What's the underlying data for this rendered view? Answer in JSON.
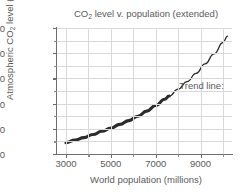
{
  "chart_data": {
    "type": "line",
    "title": "CO2 level v. population (extended)",
    "title_parts": {
      "pre": "CO",
      "sub": "2",
      "post": " level v. population (extended)"
    },
    "xlabel": "World population (millions)",
    "ylabel": "Atmospheric CO2 level (ppm)",
    "ylabel_parts": {
      "pre": "Atmospheric CO",
      "sub": "2",
      "post": " level (ppm)"
    },
    "xlim": [
      2600,
      10400
    ],
    "ylim": [
      300,
      500
    ],
    "x_ticks_major": [
      3000,
      5000,
      7000,
      9000
    ],
    "x_ticks_minor": [
      4000,
      6000,
      8000,
      10000
    ],
    "x_tick_labels": [
      "3000",
      "5000",
      "7000",
      "9000"
    ],
    "y_ticks_major": [
      300,
      340,
      380,
      420,
      460,
      500
    ],
    "y_ticks_minor": [
      320,
      360,
      400,
      440,
      480
    ],
    "y_tick_labels": [
      "300",
      "340",
      "380",
      "420",
      "460",
      "500"
    ],
    "grid": true,
    "grid_color": "#d9d9d9",
    "axis_color": "#6e6e6e",
    "series": [
      {
        "name": "Measured data band",
        "style": "thick-band",
        "color": "#2b2b2b",
        "x": [
          3000,
          3400,
          3800,
          4200,
          4600,
          5000,
          5400,
          5800,
          6200,
          6600,
          7000,
          7400,
          7600
        ],
        "values": [
          318,
          322,
          326,
          331,
          336,
          341,
          347,
          353,
          360,
          368,
          377,
          387,
          392
        ]
      },
      {
        "name": "Trend line",
        "style": "thin-line",
        "color": "#2b2b2b",
        "x": [
          7600,
          8000,
          8400,
          8800,
          9200,
          9600,
          10000,
          10200
        ],
        "values": [
          392,
          403,
          415,
          428,
          443,
          459,
          477,
          487
        ]
      }
    ],
    "annotations": [
      {
        "name": "trend-line-label",
        "text": "Trend line:",
        "x": 8050,
        "y": 408
      }
    ]
  }
}
